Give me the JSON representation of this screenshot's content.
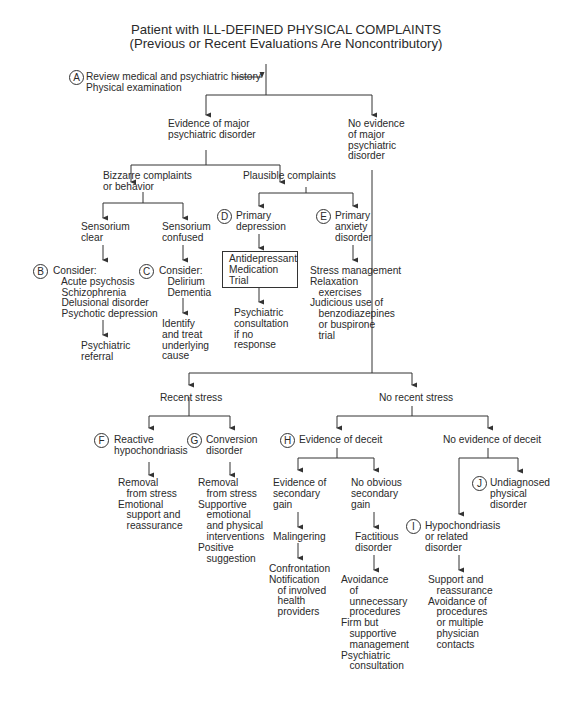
{
  "title": {
    "line1": "Patient with ILL-DEFINED PHYSICAL COMPLAINTS",
    "line2": "(Previous or Recent Evaluations Are Noncontributory)"
  },
  "nodes": {
    "a_label": "A",
    "a_text": "Review medical and psychiatric history\nPhysical examination",
    "major": "Evidence of major\npsychiatric disorder",
    "no_major": "No evidence\nof major\npsychiatric\ndisorder",
    "bizarre": "Bizzarre complaints\nor behavior",
    "plausible": "Plausible complaints",
    "sens_clear": "Sensorium\nclear",
    "sens_confused": "Sensorium\nconfused",
    "d_label": "D",
    "primary_depression": "Primary\ndepression",
    "e_label": "E",
    "primary_anxiety": "Primary\nanxiety\ndisorder",
    "b_label": "B",
    "b_text": "Consider:\n   Acute psychosis\n   Schizophrenia\n   Delusional disorder\n   Psychotic depression",
    "c_label": "C",
    "c_text": "Consider:\n   Delirium\n   Dementia",
    "antidepressant": "Antidepressant\nMedication\nTrial",
    "anxiety_tx": "Stress management\nRelaxation\n   exercises\nJudicious use of\n   benzodiazepines\n   or buspirone\n   trial",
    "psych_referral": "Psychiatric\nreferral",
    "identify_treat": "Identify\nand treat\nunderlying\ncause",
    "psych_consult": "Psychiatric\nconsultation\nif no\nresponse",
    "recent_stress": "Recent stress",
    "no_recent_stress": "No recent stress",
    "f_label": "F",
    "reactive": "Reactive\nhypochondriasis",
    "g_label": "G",
    "conversion": "Conversion\ndisorder",
    "h_label": "H",
    "deceit": "Evidence of deceit",
    "no_deceit": "No evidence of deceit",
    "f_tx": "Removal\n   from stress\nEmotional\n   support and\n   reassurance",
    "g_tx": "Removal\n   from stress\nSupportive\n   emotional\n   and physical\n   interventions\nPositive\n   suggestion",
    "secondary_gain": "Evidence of\nsecondary\ngain",
    "no_secondary_gain": "No obvious\nsecondary\ngain",
    "j_label": "J",
    "undiagnosed": "Undiagnosed\nphysical\ndisorder",
    "malingering": "Malingering",
    "factitious": "Factitious\ndisorder",
    "i_label": "I",
    "hypochondriasis": "Hypochondriasis\nor related\ndisorder",
    "malingering_tx": "Confrontation\nNotification\n   of involved\n   health\n   providers",
    "factitious_tx": "Avoidance\n   of\n   unnecessary\n   procedures\nFirm but\n   supportive\n   management\nPsychiatric\n   consultation",
    "hypo_tx": "Support and\n   reassurance\nAvoidance of\n   procedures\n   or multiple\n   physician\n   contacts"
  }
}
